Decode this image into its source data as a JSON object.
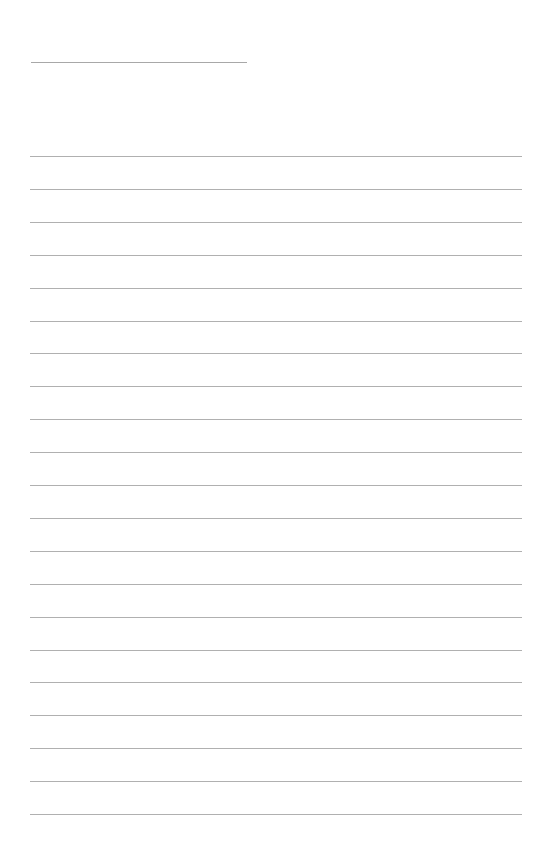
{
  "page": {
    "type": "blank lined paper",
    "title_line": {
      "label": ""
    },
    "rule_count": 21,
    "rule_first_y": 156,
    "rule_spacing": 32.9,
    "rule_color": "#b0b0b0",
    "background": "#ffffff"
  }
}
